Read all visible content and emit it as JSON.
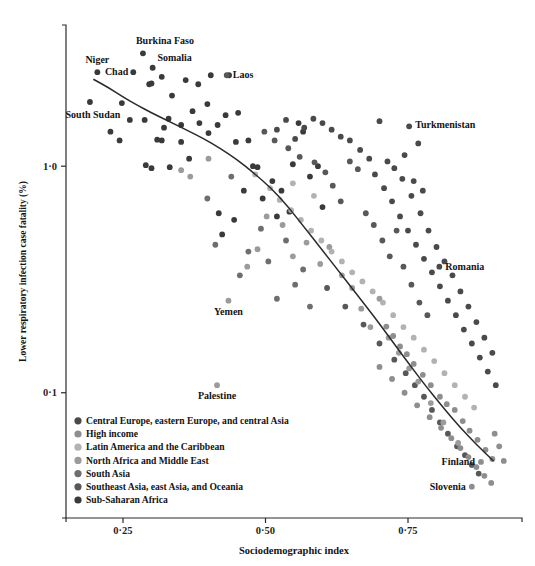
{
  "chart_data": {
    "type": "scatter",
    "title": "",
    "xlabel": "Sociodemographic index",
    "ylabel": "Lower respiratory infection case fatality (%)",
    "xlim": [
      0.15,
      0.95
    ],
    "ylim_log": [
      0.028,
      4.2
    ],
    "yscale": "log",
    "grid": false,
    "xticks": [
      0.25,
      0.5,
      0.75
    ],
    "xticklabels": [
      "0·25",
      "0·50",
      "0·75"
    ],
    "yticks": [
      1.0,
      0.1
    ],
    "yticklabels": [
      "1·0",
      "0·1"
    ],
    "legend_position": "lower-left-inside",
    "legend": [
      {
        "label": "Central Europe, eastern Europe, and central Asia",
        "color": "#4a4a4a"
      },
      {
        "label": "High income",
        "color": "#8e8e8e"
      },
      {
        "label": "Latin America and the Caribbean",
        "color": "#b2b2b2"
      },
      {
        "label": "North Africa and Middle East",
        "color": "#9b9b9b"
      },
      {
        "label": "South Asia",
        "color": "#6e6e6e"
      },
      {
        "label": "Southeast Asia, east Asia, and Oceania",
        "color": "#585858"
      },
      {
        "label": "Sub-Saharan Africa",
        "color": "#3a3a3a"
      }
    ],
    "annotations": [
      {
        "text": "Niger",
        "x": 0.205,
        "y": 2.6,
        "anchor": "middle",
        "dx": 0,
        "dy": -9
      },
      {
        "text": "Chad",
        "x": 0.268,
        "y": 2.6,
        "anchor": "end",
        "dx": -5,
        "dy": 3
      },
      {
        "text": "Burkina Faso",
        "x": 0.285,
        "y": 3.15,
        "anchor": "middle",
        "dx": 22,
        "dy": -9
      },
      {
        "text": "Somalia",
        "x": 0.302,
        "y": 2.72,
        "anchor": "middle",
        "dx": 22,
        "dy": -7
      },
      {
        "text": "South Sudan",
        "x": 0.192,
        "y": 1.92,
        "anchor": "middle",
        "dx": 3,
        "dy": 16
      },
      {
        "text": "Laos",
        "x": 0.432,
        "y": 2.52,
        "anchor": "start",
        "dx": 6,
        "dy": 3
      },
      {
        "text": "Turkmenistan",
        "x": 0.752,
        "y": 1.5,
        "anchor": "start",
        "dx": 6,
        "dy": 2
      },
      {
        "text": "Romania",
        "x": 0.805,
        "y": 0.36,
        "anchor": "start",
        "dx": 6,
        "dy": 3
      },
      {
        "text": "Yemen",
        "x": 0.435,
        "y": 0.255,
        "anchor": "middle",
        "dx": 0,
        "dy": 14
      },
      {
        "text": "Palestine",
        "x": 0.415,
        "y": 0.108,
        "anchor": "middle",
        "dx": 0,
        "dy": 14
      },
      {
        "text": "Finland",
        "x": 0.878,
        "y": 0.0495,
        "anchor": "end",
        "dx": -6,
        "dy": 3
      },
      {
        "text": "Slovenia",
        "x": 0.862,
        "y": 0.0385,
        "anchor": "end",
        "dx": -6,
        "dy": 3
      }
    ],
    "trendline": {
      "name": "fitted trend",
      "points": [
        [
          0.198,
          2.42
        ],
        [
          0.225,
          2.22
        ],
        [
          0.25,
          2.02
        ],
        [
          0.275,
          1.86
        ],
        [
          0.3,
          1.72
        ],
        [
          0.33,
          1.58
        ],
        [
          0.36,
          1.45
        ],
        [
          0.39,
          1.33
        ],
        [
          0.42,
          1.2
        ],
        [
          0.45,
          1.07
        ],
        [
          0.48,
          0.93
        ],
        [
          0.51,
          0.8
        ],
        [
          0.54,
          0.66
        ],
        [
          0.57,
          0.53
        ],
        [
          0.6,
          0.425
        ],
        [
          0.63,
          0.34
        ],
        [
          0.66,
          0.272
        ],
        [
          0.69,
          0.218
        ],
        [
          0.72,
          0.172
        ],
        [
          0.75,
          0.136
        ],
        [
          0.78,
          0.108
        ],
        [
          0.81,
          0.087
        ],
        [
          0.84,
          0.071
        ],
        [
          0.87,
          0.059
        ],
        [
          0.9,
          0.05
        ]
      ]
    },
    "series": [
      {
        "name": "Sub-Saharan Africa",
        "color": "#3a3a3a",
        "points": [
          [
            0.205,
            2.6
          ],
          [
            0.192,
            1.92
          ],
          [
            0.268,
            2.6
          ],
          [
            0.285,
            3.15
          ],
          [
            0.302,
            2.72
          ],
          [
            0.248,
            1.9
          ],
          [
            0.262,
            1.6
          ],
          [
            0.288,
            1.6
          ],
          [
            0.296,
            2.3
          ],
          [
            0.3,
            2.32
          ],
          [
            0.318,
            2.48
          ],
          [
            0.33,
            1.62
          ],
          [
            0.322,
            1.48
          ],
          [
            0.318,
            1.3
          ],
          [
            0.336,
            2.05
          ],
          [
            0.352,
            1.52
          ],
          [
            0.36,
            2.4
          ],
          [
            0.372,
            1.75
          ],
          [
            0.382,
            2.3
          ],
          [
            0.398,
            1.88
          ],
          [
            0.352,
            1.28
          ],
          [
            0.366,
            1.08
          ],
          [
            0.228,
            1.42
          ],
          [
            0.244,
            1.3
          ],
          [
            0.31,
            1.31
          ],
          [
            0.29,
            1.01
          ],
          [
            0.332,
            0.99
          ],
          [
            0.384,
            1.55
          ],
          [
            0.4,
            1.4
          ],
          [
            0.416,
            1.52
          ],
          [
            0.404,
            2.52
          ],
          [
            0.436,
            2.52
          ],
          [
            0.43,
            1.68
          ],
          [
            0.452,
            1.72
          ],
          [
            0.448,
            1.28
          ],
          [
            0.47,
            1.3
          ],
          [
            0.462,
            0.78
          ],
          [
            0.418,
            0.62
          ],
          [
            0.424,
            0.5
          ],
          [
            0.445,
            0.58
          ],
          [
            0.478,
            1.0
          ],
          [
            0.486,
            0.99
          ],
          [
            0.495,
            0.72
          ],
          [
            0.512,
            0.86
          ],
          [
            0.528,
            0.78
          ],
          [
            0.52,
            0.6
          ],
          [
            0.542,
            0.63
          ],
          [
            0.548,
            1.02
          ],
          [
            0.558,
            1.55
          ],
          [
            0.566,
            1.42
          ],
          [
            0.578,
            0.9
          ],
          [
            0.592,
            1.0
          ],
          [
            0.6,
            0.66
          ],
          [
            0.3,
            0.98
          ]
        ]
      },
      {
        "name": "South Asia",
        "color": "#6e6e6e",
        "points": [
          [
            0.398,
            0.72
          ],
          [
            0.412,
            0.45
          ],
          [
            0.44,
            0.9
          ],
          [
            0.455,
            0.33
          ],
          [
            0.47,
            0.42
          ],
          [
            0.505,
            0.38
          ],
          [
            0.492,
            0.53
          ],
          [
            0.536,
            0.47
          ],
          [
            0.552,
            0.3
          ],
          [
            0.566,
            0.35
          ],
          [
            0.52,
            0.26
          ],
          [
            0.578,
            0.24
          ]
        ]
      },
      {
        "name": "Southeast Asia, east Asia, and Oceania",
        "color": "#585858",
        "points": [
          [
            0.432,
            2.52
          ],
          [
            0.498,
            1.42
          ],
          [
            0.516,
            1.3
          ],
          [
            0.54,
            1.2
          ],
          [
            0.56,
            1.1
          ],
          [
            0.586,
            1.04
          ],
          [
            0.605,
            0.94
          ],
          [
            0.618,
            0.82
          ],
          [
            0.632,
            0.7
          ],
          [
            0.648,
            1.05
          ],
          [
            0.662,
            0.97
          ],
          [
            0.676,
            0.62
          ],
          [
            0.69,
            0.55
          ],
          [
            0.705,
            0.47
          ],
          [
            0.718,
            0.4
          ],
          [
            0.73,
            0.52
          ],
          [
            0.742,
            0.36
          ],
          [
            0.756,
            0.3
          ],
          [
            0.77,
            0.25
          ],
          [
            0.784,
            0.22
          ],
          [
            0.608,
            0.29
          ],
          [
            0.64,
            0.24
          ],
          [
            0.672,
            0.2
          ],
          [
            0.7,
            0.165
          ],
          [
            0.726,
            0.14
          ],
          [
            0.746,
            0.122
          ],
          [
            0.762,
            0.108
          ],
          [
            0.778,
            0.096
          ],
          [
            0.792,
            0.084
          ],
          [
            0.806,
            0.074
          ],
          [
            0.82,
            0.066
          ],
          [
            0.836,
            0.058
          ],
          [
            0.85,
            0.053
          ],
          [
            0.862,
            0.048
          ],
          [
            0.874,
            0.044
          ]
        ]
      },
      {
        "name": "North Africa and Middle East",
        "color": "#9b9b9b",
        "points": [
          [
            0.435,
            0.255
          ],
          [
            0.415,
            0.108
          ],
          [
            0.468,
            0.36
          ],
          [
            0.486,
            0.43
          ],
          [
            0.502,
            0.6
          ],
          [
            0.53,
            0.55
          ],
          [
            0.548,
            0.4
          ],
          [
            0.572,
            0.46
          ],
          [
            0.596,
            0.37
          ],
          [
            0.612,
            0.44
          ],
          [
            0.634,
            0.33
          ],
          [
            0.652,
            0.29
          ],
          [
            0.668,
            0.235
          ],
          [
            0.684,
            0.195
          ],
          [
            0.7,
            0.26
          ],
          [
            0.716,
            0.175
          ],
          [
            0.734,
            0.15
          ],
          [
            0.752,
            0.128
          ],
          [
            0.768,
            0.112
          ],
          [
            0.79,
            0.09
          ],
          [
            0.812,
            0.074
          ],
          [
            0.838,
            0.06
          ],
          [
            0.4,
            1.08
          ],
          [
            0.352,
            0.96
          ],
          [
            0.368,
            0.9
          ]
        ]
      },
      {
        "name": "Latin America and the Caribbean",
        "color": "#b2b2b2",
        "points": [
          [
            0.482,
            0.92
          ],
          [
            0.508,
            0.8
          ],
          [
            0.525,
            0.71
          ],
          [
            0.545,
            0.64
          ],
          [
            0.562,
            0.58
          ],
          [
            0.58,
            0.52
          ],
          [
            0.598,
            0.47
          ],
          [
            0.616,
            0.42
          ],
          [
            0.634,
            0.38
          ],
          [
            0.652,
            0.34
          ],
          [
            0.67,
            0.31
          ],
          [
            0.688,
            0.28
          ],
          [
            0.706,
            0.25
          ],
          [
            0.724,
            0.22
          ],
          [
            0.742,
            0.195
          ],
          [
            0.76,
            0.175
          ],
          [
            0.778,
            0.155
          ],
          [
            0.796,
            0.138
          ],
          [
            0.814,
            0.122
          ],
          [
            0.832,
            0.108
          ],
          [
            0.85,
            0.096
          ],
          [
            0.866,
            0.086
          ],
          [
            0.548,
            0.84
          ],
          [
            0.585,
            0.74
          ]
        ]
      },
      {
        "name": "High income",
        "color": "#8e8e8e",
        "points": [
          [
            0.878,
            0.0495
          ],
          [
            0.862,
            0.0385
          ],
          [
            0.7,
            0.13
          ],
          [
            0.722,
            0.115
          ],
          [
            0.744,
            0.1
          ],
          [
            0.766,
            0.088
          ],
          [
            0.788,
            0.078
          ],
          [
            0.808,
            0.07
          ],
          [
            0.826,
            0.063
          ],
          [
            0.842,
            0.057
          ],
          [
            0.856,
            0.052
          ],
          [
            0.87,
            0.047
          ],
          [
            0.884,
            0.043
          ],
          [
            0.896,
            0.04
          ],
          [
            0.832,
            0.084
          ],
          [
            0.846,
            0.075
          ],
          [
            0.858,
            0.068
          ],
          [
            0.872,
            0.062
          ],
          [
            0.886,
            0.056
          ],
          [
            0.898,
            0.051
          ],
          [
            0.806,
            0.096
          ],
          [
            0.818,
            0.089
          ],
          [
            0.79,
            0.108
          ],
          [
            0.776,
            0.12
          ],
          [
            0.76,
            0.134
          ],
          [
            0.748,
            0.148
          ],
          [
            0.736,
            0.16
          ],
          [
            0.724,
            0.178
          ],
          [
            0.712,
            0.196
          ],
          [
            0.902,
            0.066
          ],
          [
            0.91,
            0.058
          ],
          [
            0.918,
            0.05
          ]
        ]
      },
      {
        "name": "Central Europe, eastern Europe, and central Asia",
        "color": "#4a4a4a",
        "points": [
          [
            0.752,
            1.5
          ],
          [
            0.805,
            0.36
          ],
          [
            0.768,
            1.26
          ],
          [
            0.7,
            1.58
          ],
          [
            0.714,
            1.05
          ],
          [
            0.726,
            0.98
          ],
          [
            0.74,
            0.88
          ],
          [
            0.756,
            0.74
          ],
          [
            0.772,
            0.62
          ],
          [
            0.786,
            0.52
          ],
          [
            0.8,
            0.44
          ],
          [
            0.814,
            0.38
          ],
          [
            0.828,
            0.33
          ],
          [
            0.842,
            0.28
          ],
          [
            0.856,
            0.24
          ],
          [
            0.87,
            0.205
          ],
          [
            0.884,
            0.175
          ],
          [
            0.898,
            0.15
          ],
          [
            0.76,
            0.86
          ],
          [
            0.776,
            0.78
          ],
          [
            0.744,
            1.12
          ],
          [
            0.648,
            1.3
          ],
          [
            0.666,
            1.18
          ],
          [
            0.682,
            1.08
          ],
          [
            0.692,
            0.92
          ],
          [
            0.708,
            0.8
          ],
          [
            0.722,
            0.7
          ],
          [
            0.736,
            0.6
          ],
          [
            0.75,
            0.52
          ],
          [
            0.764,
            0.45
          ],
          [
            0.778,
            0.39
          ],
          [
            0.792,
            0.34
          ],
          [
            0.806,
            0.295
          ],
          [
            0.82,
            0.255
          ],
          [
            0.834,
            0.22
          ],
          [
            0.848,
            0.19
          ],
          [
            0.862,
            0.165
          ],
          [
            0.876,
            0.143
          ],
          [
            0.89,
            0.124
          ],
          [
            0.904,
            0.108
          ],
          [
            0.616,
            1.45
          ],
          [
            0.632,
            1.35
          ],
          [
            0.6,
            1.55
          ],
          [
            0.584,
            1.62
          ],
          [
            0.568,
            1.48
          ],
          [
            0.552,
            1.32
          ],
          [
            0.536,
            1.6
          ],
          [
            0.52,
            1.45
          ]
        ]
      }
    ]
  },
  "geometry": {
    "plot_left": 66,
    "plot_right": 522,
    "plot_top": 25,
    "plot_bottom": 518
  }
}
